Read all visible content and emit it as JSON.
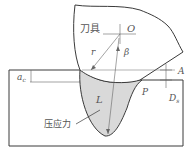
{
  "diagram": {
    "labels": {
      "tool": "刀具",
      "center": "O",
      "radius": "r",
      "angle": "β",
      "point_a": "A",
      "depth_of_cut": "a",
      "depth_of_cut_sub": "c",
      "point_p": "P",
      "depth_s": "D",
      "depth_s_sub": "s",
      "length": "L",
      "compressive_stress": "压应力"
    },
    "colors": {
      "outline": "#3a3a3a",
      "stress_fill": "#d9d9d9",
      "thin_line": "#666666"
    }
  }
}
